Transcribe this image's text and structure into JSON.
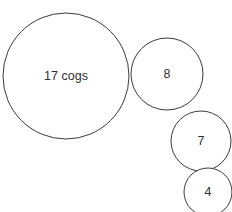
{
  "diagram": {
    "type": "circle-cluster",
    "background_color": "#ffffff",
    "stroke_color": "#3b3b3d",
    "text_color": "#2f2f31",
    "canvas": {
      "width": 232,
      "height": 212
    },
    "circles": [
      {
        "name": "circle-17-cogs",
        "label": "17 cogs",
        "cx": 66,
        "cy": 76,
        "r": 63,
        "value": 17,
        "unit": "cogs"
      },
      {
        "name": "circle-8",
        "label": "8",
        "cx": 167,
        "cy": 74,
        "r": 36,
        "value": 8,
        "unit": ""
      },
      {
        "name": "circle-7",
        "label": "7",
        "cx": 201,
        "cy": 141,
        "r": 30,
        "value": 7,
        "unit": ""
      },
      {
        "name": "circle-4",
        "label": "4",
        "cx": 208,
        "cy": 192,
        "r": 24,
        "value": 4,
        "unit": ""
      }
    ]
  }
}
